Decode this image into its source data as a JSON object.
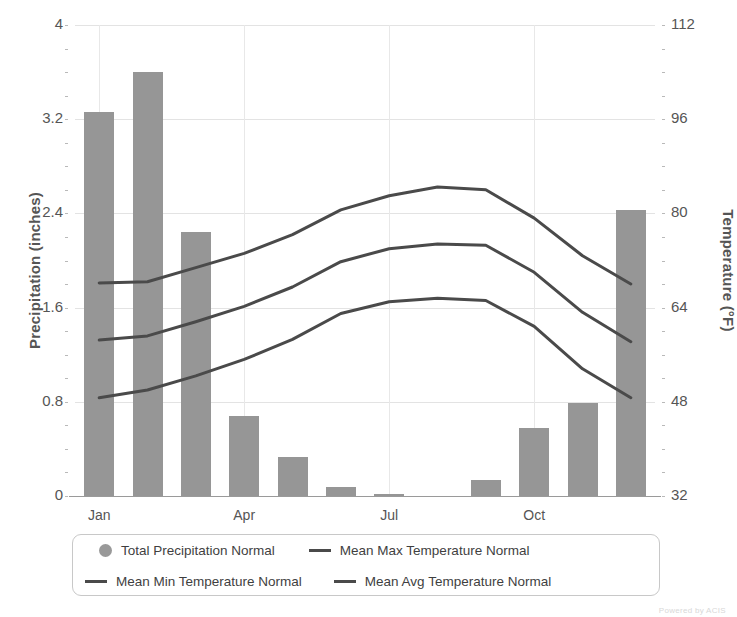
{
  "chart_data": {
    "type": "bar",
    "title": "",
    "categories": [
      "Jan",
      "Feb",
      "Mar",
      "Apr",
      "May",
      "Jun",
      "Jul",
      "Aug",
      "Sep",
      "Oct",
      "Nov",
      "Dec"
    ],
    "xlabel": "",
    "ylabel": "Precipitation (inches)",
    "y2label": "Temperature (°F)",
    "ylim": [
      0,
      4
    ],
    "y2lim": [
      32,
      112
    ],
    "yticks": [
      "0",
      "0.8",
      "1.6",
      "2.4",
      "3.2",
      "4"
    ],
    "ytick_values": [
      0,
      0.8,
      1.6,
      2.4,
      3.2,
      4
    ],
    "y2ticks": [
      "32",
      "48",
      "64",
      "80",
      "96",
      "112"
    ],
    "y2tick_values": [
      32,
      48,
      64,
      80,
      96,
      112
    ],
    "xtick_labels": [
      "Jan",
      "Apr",
      "Jul",
      "Oct"
    ],
    "xtick_categories": [
      "Jan",
      "Apr",
      "Jul",
      "Oct"
    ],
    "grid": true,
    "legend_position": "bottom",
    "bar_color": "#969696",
    "line_color": "#4a4a4a",
    "series": [
      {
        "name": "Total Precipitation Normal",
        "kind": "bar",
        "axis": "left",
        "unit": "inches",
        "marker": "circle",
        "values": [
          3.26,
          3.6,
          2.24,
          0.68,
          0.33,
          0.08,
          0.02,
          0.0,
          0.14,
          0.58,
          0.79,
          2.43
        ]
      },
      {
        "name": "Mean Max Temperature Normal",
        "kind": "line",
        "axis": "right",
        "unit": "°F",
        "marker": "line",
        "values": [
          68.2,
          68.4,
          70.8,
          73.2,
          76.4,
          80.6,
          83.0,
          84.5,
          84.0,
          79.2,
          72.8,
          68.0
        ]
      },
      {
        "name": "Mean Min Temperature Normal",
        "kind": "line",
        "axis": "right",
        "unit": "°F",
        "marker": "line",
        "values": [
          48.7,
          50.0,
          52.4,
          55.2,
          58.6,
          63.0,
          65.0,
          65.6,
          65.2,
          60.8,
          53.6,
          48.7
        ]
      },
      {
        "name": "Mean Avg Temperature Normal",
        "kind": "line",
        "axis": "right",
        "unit": "°F",
        "marker": "line",
        "values": [
          58.5,
          59.2,
          61.6,
          64.2,
          67.5,
          71.8,
          74.0,
          74.8,
          74.6,
          70.0,
          63.2,
          58.2
        ]
      }
    ]
  },
  "legend": {
    "items": [
      {
        "label": "Total Precipitation Normal",
        "marker": "circle"
      },
      {
        "label": "Mean Max Temperature Normal",
        "marker": "line"
      },
      {
        "label": "Mean Min Temperature Normal",
        "marker": "line"
      },
      {
        "label": "Mean Avg Temperature Normal",
        "marker": "line"
      }
    ]
  },
  "watermark": "Powered by ACIS"
}
